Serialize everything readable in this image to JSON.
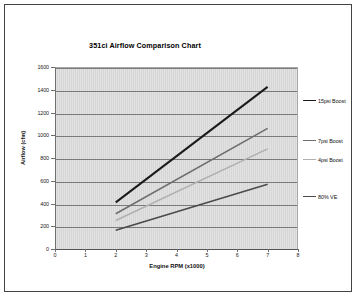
{
  "chart_data": {
    "type": "line",
    "title": "351ci Airflow Comparison Chart",
    "xlabel": "Engine RPM (x1000)",
    "ylabel": "Airflow (cfm)",
    "xlim": [
      0,
      8
    ],
    "ylim": [
      0,
      1600
    ],
    "xticks": [
      "0",
      "1",
      "2",
      "3",
      "4",
      "5",
      "6",
      "7",
      "8"
    ],
    "yticks": [
      "0",
      "200",
      "400",
      "600",
      "800",
      "1000",
      "1200",
      "1400",
      "1600"
    ],
    "grid": "horizontal",
    "legend_position": "right",
    "x": [
      2,
      7
    ],
    "series": [
      {
        "name": "15psi Boost",
        "color": "#1a1a1a",
        "width": 2.0,
        "values": [
          410,
          1425
        ]
      },
      {
        "name": "7psi Boost",
        "color": "#6e6e6e",
        "width": 1.6,
        "values": [
          310,
          1060
        ]
      },
      {
        "name": "4psi Boost",
        "color": "#b0b0b0",
        "width": 1.6,
        "values": [
          250,
          880
        ]
      },
      {
        "name": "80% VE",
        "color": "#4a4a4a",
        "width": 1.6,
        "values": [
          165,
          570
        ]
      }
    ]
  },
  "legend": {
    "items": [
      {
        "label": "15psi Boost",
        "color": "#1a1a1a",
        "top": 86
      },
      {
        "label": "7psi Boost",
        "color": "#6e6e6e",
        "top": 126
      },
      {
        "label": "4psi Boost",
        "color": "#b0b0b0",
        "top": 145
      },
      {
        "label": "80% VE",
        "color": "#4a4a4a",
        "top": 182
      }
    ]
  },
  "plot_style": {
    "background": "#d6d6d6",
    "gridline_color": "#7a7a7a",
    "border_color": "#444444"
  }
}
